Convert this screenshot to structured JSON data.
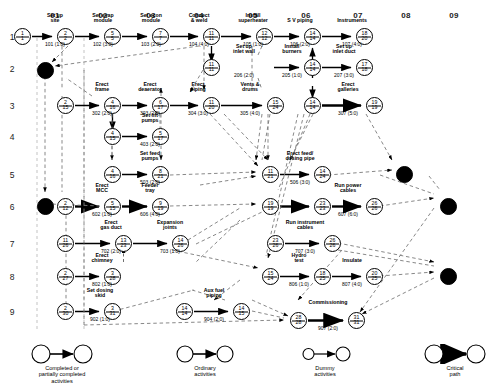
{
  "axes": {
    "columns": [
      "01",
      "02",
      "03",
      "04",
      "05",
      "06",
      "07",
      "08",
      "09"
    ],
    "rows": [
      "1",
      "2",
      "3",
      "4",
      "5",
      "6",
      "7",
      "8",
      "9"
    ]
  },
  "nodes": [
    {
      "id": "n1",
      "early": "1",
      "late": "1",
      "x": 14,
      "y": 28,
      "filled": false
    },
    {
      "id": "n2",
      "early": "2",
      "late": "2",
      "x": 57,
      "y": 28,
      "filled": false
    },
    {
      "id": "n3",
      "early": "5",
      "late": "5",
      "x": 104,
      "y": 28,
      "filled": false
    },
    {
      "id": "n4",
      "early": "7",
      "late": "7",
      "x": 152,
      "y": 28,
      "filled": false
    },
    {
      "id": "n5",
      "early": "11",
      "late": "11",
      "x": 203,
      "y": 28,
      "filled": false
    },
    {
      "id": "n6",
      "early": "12",
      "late": "12",
      "x": 256,
      "y": 28,
      "filled": false
    },
    {
      "id": "n7",
      "early": "14",
      "late": "14",
      "x": 304,
      "y": 28,
      "filled": false
    },
    {
      "id": "n8",
      "early": "18",
      "late": "20",
      "x": 356,
      "y": 28,
      "filled": false
    },
    {
      "id": "n9",
      "early": "11",
      "late": "11",
      "x": 203,
      "y": 59,
      "filled": false
    },
    {
      "id": "n10",
      "early": "14",
      "late": "14",
      "x": 304,
      "y": 59,
      "filled": false
    },
    {
      "id": "n11",
      "early": "17",
      "late": "18",
      "x": 356,
      "y": 59,
      "filled": false
    },
    {
      "id": "n12",
      "early": "2",
      "late": "15",
      "x": 57,
      "y": 97,
      "filled": false
    },
    {
      "id": "n13",
      "early": "4",
      "late": "16",
      "x": 104,
      "y": 97,
      "filled": false
    },
    {
      "id": "n14",
      "early": "6",
      "late": "17",
      "x": 152,
      "y": 97,
      "filled": false
    },
    {
      "id": "n15",
      "early": "11",
      "late": "20",
      "x": 203,
      "y": 97,
      "filled": false
    },
    {
      "id": "n16",
      "early": "15",
      "late": "24",
      "x": 267,
      "y": 97,
      "filled": false
    },
    {
      "id": "n17",
      "early": "14",
      "late": "14",
      "x": 304,
      "y": 97,
      "filled": false
    },
    {
      "id": "n18",
      "early": "19",
      "late": "19",
      "x": 366,
      "y": 97,
      "filled": false
    },
    {
      "id": "n19",
      "early": "4",
      "late": "15",
      "x": 104,
      "y": 128,
      "filled": false
    },
    {
      "id": "n20",
      "early": "5",
      "late": "17",
      "x": 152,
      "y": 128,
      "filled": false
    },
    {
      "id": "n21",
      "early": "4",
      "late": "16",
      "x": 104,
      "y": 166,
      "filled": false
    },
    {
      "id": "n22",
      "early": "8",
      "late": "21",
      "x": 152,
      "y": 166,
      "filled": false
    },
    {
      "id": "n23",
      "early": "11",
      "late": "21",
      "x": 262,
      "y": 166,
      "filled": false
    },
    {
      "id": "n24",
      "early": "14",
      "late": "24",
      "x": 314,
      "y": 166,
      "filled": false
    },
    {
      "id": "n25",
      "early": "2",
      "late": "12",
      "x": 57,
      "y": 198,
      "filled": false
    },
    {
      "id": "n26",
      "early": "5",
      "late": "15",
      "x": 104,
      "y": 198,
      "filled": false
    },
    {
      "id": "n27",
      "early": "9",
      "late": "19",
      "x": 152,
      "y": 198,
      "filled": false
    },
    {
      "id": "n28",
      "early": "19",
      "late": "19",
      "x": 262,
      "y": 198,
      "filled": false
    },
    {
      "id": "n29",
      "early": "23",
      "late": "23",
      "x": 314,
      "y": 198,
      "filled": false
    },
    {
      "id": "n30",
      "early": "26",
      "late": "26",
      "x": 366,
      "y": 198,
      "filled": false
    },
    {
      "id": "n31",
      "early": "11",
      "late": "26",
      "x": 57,
      "y": 235,
      "filled": false
    },
    {
      "id": "n32",
      "early": "13",
      "late": "23",
      "x": 115,
      "y": 235,
      "filled": false
    },
    {
      "id": "n33",
      "early": "14",
      "late": "26",
      "x": 172,
      "y": 235,
      "filled": false
    },
    {
      "id": "n34",
      "early": "23",
      "late": "26",
      "x": 267,
      "y": 235,
      "filled": false
    },
    {
      "id": "n35",
      "early": "26",
      "late": "26",
      "x": 324,
      "y": 235,
      "filled": false
    },
    {
      "id": "n36",
      "early": "2",
      "late": "27",
      "x": 57,
      "y": 268,
      "filled": false
    },
    {
      "id": "n37",
      "early": "3",
      "late": "28",
      "x": 104,
      "y": 268,
      "filled": false
    },
    {
      "id": "n38",
      "early": "15",
      "late": "24",
      "x": 262,
      "y": 268,
      "filled": false
    },
    {
      "id": "n39",
      "early": "18",
      "late": "25",
      "x": 314,
      "y": 268,
      "filled": false
    },
    {
      "id": "n40",
      "early": "20",
      "late": "25",
      "x": 366,
      "y": 268,
      "filled": false
    },
    {
      "id": "n41",
      "early": "2",
      "late": "30",
      "x": 57,
      "y": 303,
      "filled": false
    },
    {
      "id": "n42",
      "early": "3",
      "late": "31",
      "x": 104,
      "y": 303,
      "filled": false
    },
    {
      "id": "n43",
      "early": "14",
      "late": "14",
      "x": 176,
      "y": 303,
      "filled": false
    },
    {
      "id": "n44",
      "early": "14",
      "late": "15",
      "x": 233,
      "y": 303,
      "filled": false
    },
    {
      "id": "n45",
      "early": "28",
      "late": "28",
      "x": 290,
      "y": 312,
      "filled": false
    },
    {
      "id": "n46",
      "early": "31",
      "late": "31",
      "x": 348,
      "y": 312,
      "filled": false
    },
    {
      "id": "e1",
      "early": "",
      "late": "",
      "x": 37,
      "y": 62,
      "filled": true
    },
    {
      "id": "e2",
      "early": "",
      "late": "",
      "x": 37,
      "y": 198,
      "filled": true
    },
    {
      "id": "e3",
      "early": "",
      "late": "",
      "x": 396,
      "y": 166,
      "filled": true
    },
    {
      "id": "e4",
      "early": "",
      "late": "",
      "x": 440,
      "y": 198,
      "filled": true
    },
    {
      "id": "e5",
      "early": "",
      "late": "",
      "x": 440,
      "y": 268,
      "filled": true
    }
  ],
  "activities": [
    {
      "name": "Set up\nsite",
      "code": "101 (1:0)",
      "lx": 55,
      "ly": 13,
      "cx": 55,
      "cy": 42
    },
    {
      "name": "Set evap\nmodule",
      "code": "102 (3:0)",
      "lx": 103,
      "ly": 13,
      "cx": 103,
      "cy": 42
    },
    {
      "name": "Set econ\nmodule",
      "code": "103 (2:0)",
      "lx": 151,
      "ly": 13,
      "cx": 151,
      "cy": 42
    },
    {
      "name": "Connect\n& weld",
      "code": "104 (4:0)",
      "lx": 199,
      "ly": 13,
      "cx": 199,
      "cy": 42
    },
    {
      "name": "Install\nsuperheater",
      "code": "105 (1:0)",
      "lx": 253,
      "ly": 13,
      "cx": 253,
      "cy": 42
    },
    {
      "name": "S V piping",
      "code": "106 (2:0)",
      "lx": 300,
      "ly": 18,
      "cx": 300,
      "cy": 42
    },
    {
      "name": "Instruments",
      "code": "107 (4:0)",
      "lx": 352,
      "ly": 18,
      "cx": 352,
      "cy": 42
    },
    {
      "name": "Set up\ninlet wall",
      "code": "206 (2:0)",
      "lx": 244,
      "ly": 44,
      "cx": 244,
      "cy": 73
    },
    {
      "name": "Install\nburners",
      "code": "205 (1:0)",
      "lx": 292,
      "ly": 44,
      "cx": 292,
      "cy": 73
    },
    {
      "name": "Set up\ninlet duct",
      "code": "207 (3:0)",
      "lx": 344,
      "ly": 44,
      "cx": 344,
      "cy": 73
    },
    {
      "name": "Erect\nframe",
      "code": "302 (2:0)",
      "lx": 102,
      "ly": 82,
      "cx": 102,
      "cy": 111
    },
    {
      "name": "Erect\ndeaerator",
      "code": "303 (2:0)",
      "lx": 150,
      "ly": 82,
      "cx": 150,
      "cy": 111
    },
    {
      "name": "Erect\npiping",
      "code": "304 (3:0)",
      "lx": 198,
      "ly": 82,
      "cx": 198,
      "cy": 111
    },
    {
      "name": "Vents &\ndrums",
      "code": "305 (4:0)",
      "lx": 250,
      "ly": 82,
      "cx": 250,
      "cy": 111
    },
    {
      "name": "Erect\ngalleries",
      "code": "307 (5:0)",
      "lx": 348,
      "ly": 82,
      "cx": 348,
      "cy": 111
    },
    {
      "name": "Set lift\npumps",
      "code": "403 (2:0)",
      "lx": 150,
      "ly": 113,
      "cx": 150,
      "cy": 142
    },
    {
      "name": "Set feed\npumps",
      "code": "503 (2:0)",
      "lx": 150,
      "ly": 151,
      "cx": 150,
      "cy": 180
    },
    {
      "name": "Erect feed/\ndosing pipe",
      "code": "506 (3:0)",
      "lx": 300,
      "ly": 151,
      "cx": 300,
      "cy": 180
    },
    {
      "name": "Erect\nMCC",
      "code": "602 (1:0)",
      "lx": 102,
      "ly": 183,
      "cx": 102,
      "cy": 212
    },
    {
      "name": "Feeder\ntray",
      "code": "606 (4:0)",
      "lx": 150,
      "ly": 183,
      "cx": 150,
      "cy": 212
    },
    {
      "name": "Run power\ncables",
      "code": "607 (6:0)",
      "lx": 348,
      "ly": 183,
      "cx": 348,
      "cy": 212
    },
    {
      "name": "Erect\ngas duct",
      "code": "702 (2:0)",
      "lx": 111,
      "ly": 220,
      "cx": 111,
      "cy": 249
    },
    {
      "name": "Expansion\njoints",
      "code": "703 (1:0)",
      "lx": 170,
      "ly": 220,
      "cx": 170,
      "cy": 249
    },
    {
      "name": "Run instrument\ncables",
      "code": "707 (3:0)",
      "lx": 305,
      "ly": 220,
      "cx": 305,
      "cy": 249
    },
    {
      "name": "Erect\nchimney",
      "code": "802 (1:0)",
      "lx": 102,
      "ly": 253,
      "cx": 102,
      "cy": 282
    },
    {
      "name": "Hydro\ntest",
      "code": "806 (1:0)",
      "lx": 299,
      "ly": 253,
      "cx": 299,
      "cy": 282
    },
    {
      "name": "Insulate",
      "code": "807 (4:0)",
      "lx": 352,
      "ly": 258,
      "cx": 352,
      "cy": 282
    },
    {
      "name": "Set dosing\nskid",
      "code": "902 (1:0)",
      "lx": 100,
      "ly": 288,
      "cx": 100,
      "cy": 317
    },
    {
      "name": "Aux fuel\npiping",
      "code": "904 (2:0)",
      "lx": 214,
      "ly": 288,
      "cx": 214,
      "cy": 317
    },
    {
      "name": "Commissioning",
      "code": "907 (2:0)",
      "lx": 328,
      "ly": 300,
      "cx": 328,
      "cy": 326
    }
  ],
  "legend": [
    {
      "caption": "Completed or\npartially completed\nactivities",
      "type": "completed"
    },
    {
      "caption": "Ordinary\nactivities",
      "type": "ordinary"
    },
    {
      "caption": "Dummy\nactivities",
      "type": "dummy"
    },
    {
      "caption": "Critical\npath",
      "type": "critical"
    }
  ],
  "colors": {
    "line": "#000000",
    "dummy": "#7a7a7a",
    "background": "#ffffff",
    "node_fill": "#ffffff",
    "node_filled": "#000000"
  }
}
